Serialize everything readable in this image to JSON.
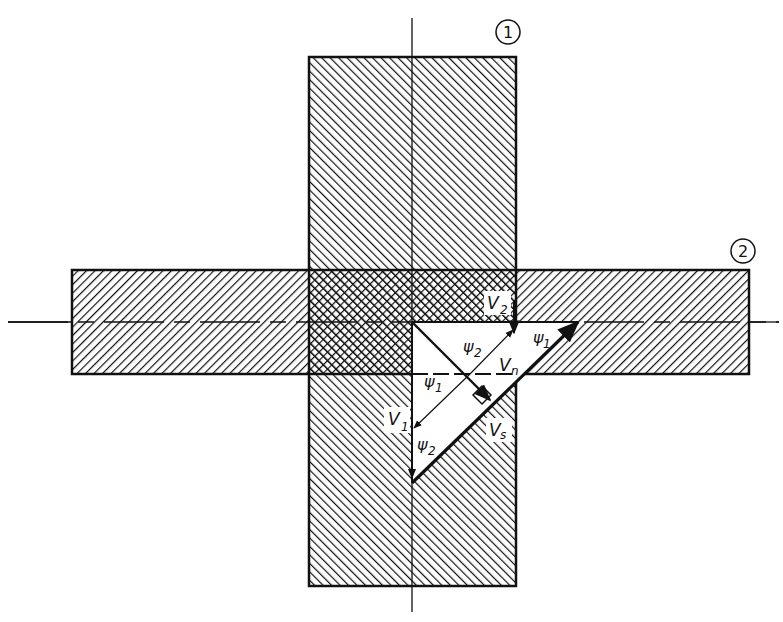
{
  "diagram": {
    "type": "engineering-section-intersection",
    "members": [
      {
        "id": "1",
        "label": "1",
        "orientation": "vertical"
      },
      {
        "id": "2",
        "label": "2",
        "orientation": "horizontal"
      }
    ],
    "vectors": {
      "V1": {
        "base": "V",
        "sub": "1"
      },
      "V2": {
        "base": "V",
        "sub": "2"
      },
      "Vn": {
        "base": "V",
        "sub": "n"
      },
      "Vs": {
        "base": "V",
        "sub": "s"
      }
    },
    "angles": {
      "psi1": {
        "base": "ψ",
        "sub": "1"
      },
      "psi2": {
        "base": "ψ",
        "sub": "2"
      }
    },
    "colors": {
      "ink": "#111111",
      "background": "#ffffff"
    }
  }
}
